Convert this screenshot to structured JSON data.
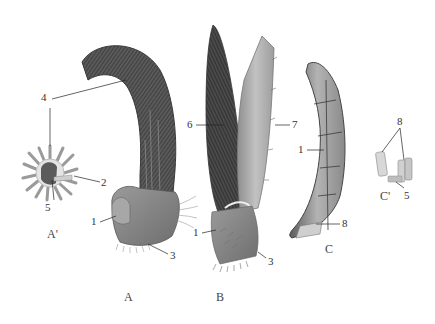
{
  "figure": {
    "panels": [
      {
        "id": "A",
        "label": "A"
      },
      {
        "id": "A_prime",
        "label": "A'"
      },
      {
        "id": "B",
        "label": "B"
      },
      {
        "id": "C",
        "label": "C"
      },
      {
        "id": "C_prime",
        "label": "C'"
      }
    ],
    "callouts": {
      "a_4": "4",
      "a_2": "2",
      "a_5": "5",
      "a_1": "1",
      "a_3": "3",
      "b_6": "6",
      "b_7": "7",
      "b_1": "1",
      "b_3": "3",
      "c_1": "1",
      "c_8": "8",
      "cp_8": "8",
      "cp_5": "5"
    },
    "colors": {
      "bristle_dark": "#3f3f3f",
      "bristle_mid": "#6a6a6a",
      "base_gray": "#8c8c8c",
      "blade_light": "#b9b9b9",
      "claw_gray": "#9a9a9a",
      "leader_line": "#222222"
    }
  }
}
